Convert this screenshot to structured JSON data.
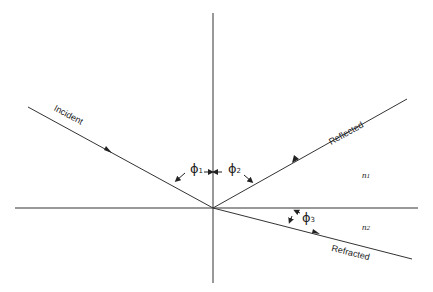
{
  "diagram": {
    "title": "",
    "rays": {
      "incident": "Incident",
      "reflected": "Reflected",
      "refracted": "Refracted"
    },
    "angles": [
      {
        "symbol": "ϕ",
        "sub": "1"
      },
      {
        "symbol": "ϕ",
        "sub": "2"
      },
      {
        "symbol": "ϕ",
        "sub": "3"
      }
    ],
    "media": [
      {
        "symbol": "n",
        "sub": "1"
      },
      {
        "symbol": "n",
        "sub": "2"
      }
    ],
    "line_color": "#333333"
  }
}
